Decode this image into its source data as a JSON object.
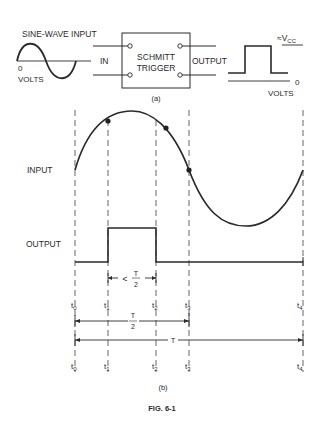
{
  "part_a": {
    "caption": "(a)",
    "input_label": "SINE-WAVE INPUT",
    "input_zero": "0",
    "input_volts": "VOLTS",
    "in_label": "IN",
    "block_line1": "SCHMITT",
    "block_line2": "TRIGGER",
    "output_label": "OUTPUT",
    "vcc_prefix": "≈V",
    "vcc_sub": "CC",
    "output_zero": "0",
    "output_volts": "VOLTS"
  },
  "part_b": {
    "caption": "(b)",
    "input_row_label": "INPUT",
    "output_row_label": "OUTPUT",
    "times": [
      {
        "name": "t",
        "sub": "0"
      },
      {
        "name": "t",
        "sub": "1"
      },
      {
        "name": "t",
        "sub": "2"
      },
      {
        "name": "t",
        "sub": "3"
      },
      {
        "name": "t",
        "sub": "4"
      }
    ],
    "interval_lt": "<",
    "interval_T": "T",
    "interval_2": "2",
    "half_T": "T",
    "half_2": "2",
    "period_T": "T"
  },
  "figure_caption": "FIG. 6-1",
  "colors": {
    "ink": "#2a2a2a",
    "dash": "#555555",
    "background": "#ffffff"
  }
}
